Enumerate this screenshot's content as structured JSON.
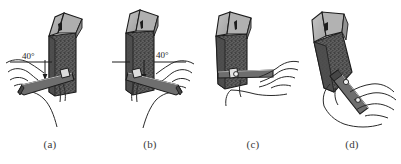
{
  "figure": {
    "width": 401,
    "height": 164,
    "background": "#ffffff"
  },
  "palette": {
    "outline": "#1c1c1c",
    "block_top_light": "#b4b4b4",
    "block_top_mid": "#9a9a9a",
    "block_body_dark": "#5a5a5a",
    "block_body_speckle": "#2b2b2b",
    "tool_gray": "#6e6e6e",
    "tool_gray_dark": "#4a4a4a",
    "hand_line": "#2a2a2a",
    "hand_fill": "#ffffff",
    "caption_text": "#3a3a3a"
  },
  "panels": [
    {
      "id": "a",
      "caption": "(a)",
      "angle_label": "40°",
      "has_angle_label": true,
      "description": "Hand holds flat sharpening file horizontally against the speckled block face; reference line and arrow mark the 40 degree angle on the left side."
    },
    {
      "id": "b",
      "caption": "(b)",
      "angle_label": "40°",
      "has_angle_label": true,
      "description": "Mirrored grip, file tilted the other way with the 40 degree angle marked on the right side of the block."
    },
    {
      "id": "c",
      "caption": "(c)",
      "angle_label": "",
      "has_angle_label": false,
      "description": "File held level and pressed flat across the bottom edge of the block with both fingers supporting it."
    },
    {
      "id": "d",
      "caption": "(d)",
      "angle_label": "",
      "has_angle_label": false,
      "description": "Block tipped on a diagonal while the file is drawn downward along the angled face."
    }
  ]
}
